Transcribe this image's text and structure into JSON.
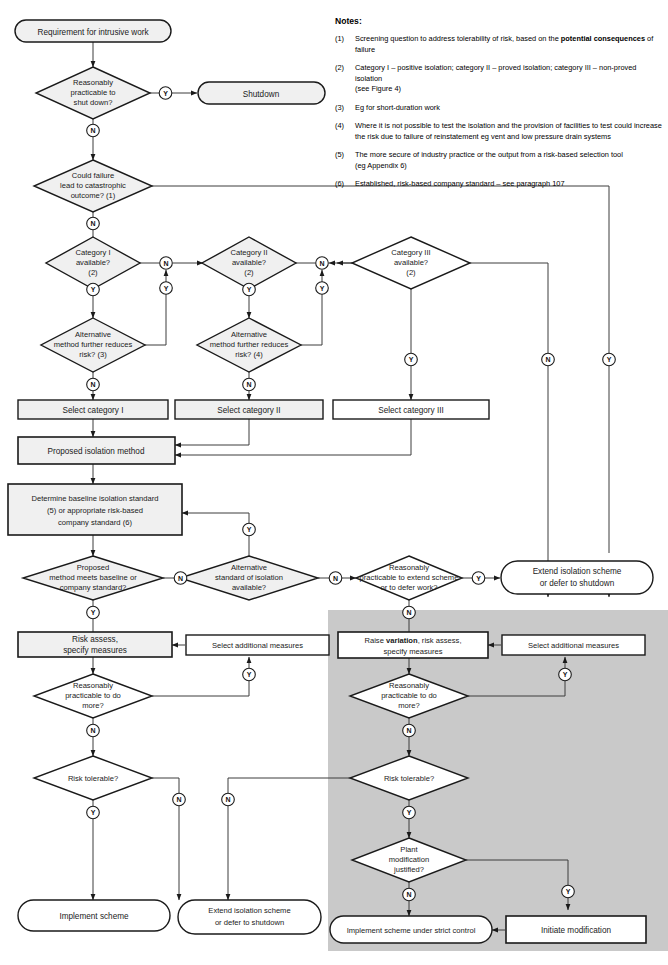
{
  "diagram": {
    "colors": {
      "shape_fill": "#f0f0f0",
      "shape_fill_white": "#ffffff",
      "shape_stroke": "#1a1a1a",
      "line": "#3c3c3c",
      "shaded_region": "#c9c9c9",
      "text": "#1a1a1a"
    },
    "shaded_region_label": "variation branch (shaded)"
  },
  "notes": {
    "heading": "Notes:",
    "items": [
      {
        "num": "(1)",
        "pre": "Screening question to address tolerability of risk, based on the ",
        "bold": "potential consequences",
        "post": " of failure"
      },
      {
        "num": "(2)",
        "pre": "Category I – positive isolation; category II – proved isolation; category III – non-proved isolation",
        "bold": "",
        "post": "",
        "line2": "(see Figure 4)"
      },
      {
        "num": "(3)",
        "pre": "Eg for short-duration work",
        "bold": "",
        "post": ""
      },
      {
        "num": "(4)",
        "pre": "Where it is not possible to test the isolation and the provision of facilities to test could increase",
        "bold": "",
        "post": "",
        "line2": "the risk due to failure of reinstatement eg vent and low pressure drain systems"
      },
      {
        "num": "(5)",
        "pre": "The more secure of industry practice or the output from a risk-based selection tool",
        "bold": "",
        "post": "",
        "line2": "(eg Appendix 6)"
      },
      {
        "num": "(6)",
        "pre": "Established, risk-based company standard – see paragraph 107",
        "bold": "",
        "post": ""
      }
    ]
  },
  "nodes": {
    "start": {
      "label": "Requirement for intrusive work",
      "shape": "stadium"
    },
    "d_shutdown": {
      "l1": "Reasonably",
      "l2": "practicable to",
      "l3": "shut down?",
      "shape": "decision"
    },
    "shutdown": {
      "label": "Shutdown",
      "shape": "stadium"
    },
    "d_catastrophic": {
      "l1": "Could failure",
      "l2": "lead to catastrophic",
      "l3": "outcome? (1)",
      "shape": "decision"
    },
    "d_cat1": {
      "l1": "Category I",
      "l2": "available?",
      "l3": "(2)",
      "shape": "decision"
    },
    "d_cat2": {
      "l1": "Category II",
      "l2": "available?",
      "l3": "(2)",
      "shape": "decision"
    },
    "d_cat3": {
      "l1": "Category III",
      "l2": "available?",
      "l3": "(2)",
      "shape": "decision"
    },
    "d_alt1": {
      "l1": "Alternative",
      "l2": "method further reduces",
      "l3": "risk? (3)",
      "shape": "decision"
    },
    "d_alt2": {
      "l1": "Alternative",
      "l2": "method further reduces",
      "l3": "risk? (4)",
      "shape": "decision"
    },
    "sel_cat1": {
      "label": "Select category I",
      "shape": "process"
    },
    "sel_cat2": {
      "label": "Select category II",
      "shape": "process"
    },
    "sel_cat3": {
      "label": "Select category III",
      "shape": "process"
    },
    "proposed": {
      "label": "Proposed isolation method",
      "shape": "process"
    },
    "baseline": {
      "l1": "Determine baseline isolation standard",
      "l2": "(5) or appropriate risk-based",
      "l3": "company standard (6)",
      "shape": "process"
    },
    "d_meets": {
      "l1": "Proposed",
      "l2": "method meets baseline or",
      "l3": "company standard?",
      "shape": "decision"
    },
    "d_altstd": {
      "l1": "Alternative",
      "l2": "standard of isolation",
      "l3": "available?",
      "shape": "decision"
    },
    "d_extend": {
      "l1": "Reasonably",
      "l2": "practicable to extend scheme",
      "l3": "or to defer work?",
      "shape": "decision"
    },
    "extend_top": {
      "l1": "Extend isolation scheme",
      "l2": "or defer to shutdown",
      "shape": "stadium"
    },
    "risk_assess": {
      "l1": "Risk assess,",
      "l2": "specify measures",
      "shape": "process"
    },
    "sel_add_left": {
      "label": "Select additional measures",
      "shape": "process"
    },
    "d_more_left": {
      "l1": "Reasonably",
      "l2": "practicable to do",
      "l3": "more?",
      "shape": "decision"
    },
    "d_tol_left": {
      "l1": "Risk tolerable?",
      "shape": "decision"
    },
    "implement": {
      "label": "Implement scheme",
      "shape": "stadium"
    },
    "extend_bottom": {
      "l1": "Extend isolation scheme",
      "l2": "or defer to shutdown",
      "shape": "stadium"
    },
    "raise_var": {
      "pre": "Raise ",
      "bold": "variation",
      "post": ", risk assess,",
      "l2": "specify measures",
      "shape": "process"
    },
    "sel_add_right": {
      "label": "Select additional measures",
      "shape": "process"
    },
    "d_more_right": {
      "l1": "Reasonably",
      "l2": "practicable to do",
      "l3": "more?",
      "shape": "decision"
    },
    "d_tol_right": {
      "l1": "Risk tolerable?",
      "shape": "decision"
    },
    "d_plantmod": {
      "l1": "Plant",
      "l2": "modification",
      "l3": "justified?",
      "shape": "decision"
    },
    "implement_strict": {
      "label": "Implement scheme under strict control",
      "shape": "stadium"
    },
    "initiate_mod": {
      "label": "Initiate modification",
      "shape": "process"
    }
  },
  "edge_labels": {
    "yes": "Y",
    "no": "N",
    "list": [
      {
        "id": "shutdown_y",
        "text": "Y"
      },
      {
        "id": "shutdown_n",
        "text": "N"
      },
      {
        "id": "catastrophic_n",
        "text": "N"
      },
      {
        "id": "cat1_n",
        "text": "N"
      },
      {
        "id": "cat1_y",
        "text": "Y"
      },
      {
        "id": "alt1_n",
        "text": "N"
      },
      {
        "id": "alt1_y",
        "text": "Y"
      },
      {
        "id": "cat2_n",
        "text": "N"
      },
      {
        "id": "cat2_y",
        "text": "Y"
      },
      {
        "id": "alt2_n",
        "text": "N"
      },
      {
        "id": "alt2_y",
        "text": "Y"
      },
      {
        "id": "cat3_y",
        "text": "Y"
      },
      {
        "id": "cat3_n",
        "text": "N"
      },
      {
        "id": "catastrophic_y",
        "text": "Y"
      },
      {
        "id": "meets_y",
        "text": "Y"
      },
      {
        "id": "meets_n",
        "text": "N"
      },
      {
        "id": "altstd_y",
        "text": "Y"
      },
      {
        "id": "altstd_n",
        "text": "N"
      },
      {
        "id": "extend_y",
        "text": "Y"
      },
      {
        "id": "extend_n",
        "text": "N"
      },
      {
        "id": "more_left_y",
        "text": "Y"
      },
      {
        "id": "more_left_n",
        "text": "N"
      },
      {
        "id": "tol_left_y",
        "text": "Y"
      },
      {
        "id": "tol_left_n",
        "text": "N"
      },
      {
        "id": "more_right_y",
        "text": "Y"
      },
      {
        "id": "more_right_n",
        "text": "N"
      },
      {
        "id": "tol_right_y",
        "text": "Y"
      },
      {
        "id": "tol_right_n",
        "text": "N"
      },
      {
        "id": "plantmod_y",
        "text": "Y"
      },
      {
        "id": "plantmod_n",
        "text": "N"
      }
    ]
  }
}
